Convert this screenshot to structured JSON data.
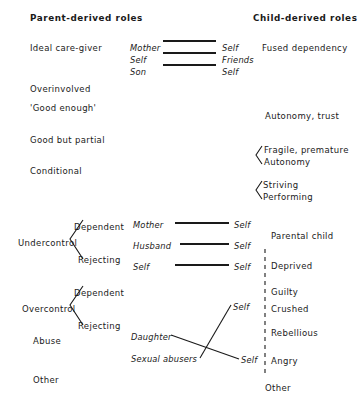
{
  "figure": {
    "headers": {
      "left": "Parent-derived roles",
      "right": "Child-derived roles"
    },
    "parent_roles": [
      {
        "label": "Ideal care-giver",
        "x": 30,
        "y": 44
      },
      {
        "label": "Overinvolved",
        "x": 30,
        "y": 85
      },
      {
        "label": "'Good enough'",
        "x": 30,
        "y": 104
      },
      {
        "label": "Good but partial",
        "x": 30,
        "y": 136
      },
      {
        "label": "Conditional",
        "x": 30,
        "y": 167
      },
      {
        "label": "Undercontrol",
        "x": 18,
        "y": 239
      },
      {
        "label": "Overcontrol",
        "x": 22,
        "y": 305
      },
      {
        "label": "Abuse",
        "x": 33,
        "y": 337
      },
      {
        "label": "Other",
        "x": 33,
        "y": 376
      }
    ],
    "branch_labels": [
      {
        "label": "Dependent",
        "x": 74,
        "y": 223
      },
      {
        "label": "Rejecting",
        "x": 78,
        "y": 256
      },
      {
        "label": "Dependent",
        "x": 74,
        "y": 289
      },
      {
        "label": "Rejecting",
        "x": 78,
        "y": 322
      }
    ],
    "child_roles": [
      {
        "label": "Fused dependency",
        "x": 262,
        "y": 46
      },
      {
        "label": "Autonomy, trust",
        "x": 265,
        "y": 114
      },
      {
        "label": "Fragile, premature",
        "x": 264,
        "y": 150
      },
      {
        "label": "Autonomy",
        "x": 264,
        "y": 161
      },
      {
        "label": "Striving",
        "x": 263,
        "y": 184
      },
      {
        "label": "Performing",
        "x": 263,
        "y": 195
      },
      {
        "label": "Parental child",
        "x": 271,
        "y": 234
      },
      {
        "label": "Deprived",
        "x": 271,
        "y": 263
      },
      {
        "label": "Guilty",
        "x": 271,
        "y": 290
      },
      {
        "label": "Crushed",
        "x": 271,
        "y": 308
      },
      {
        "label": "Rebellious",
        "x": 271,
        "y": 331
      },
      {
        "label": "Angry",
        "x": 271,
        "y": 360
      },
      {
        "label": "Other",
        "x": 265,
        "y": 386
      }
    ],
    "role_pairs": [
      {
        "left": "Mother",
        "left_x": 130,
        "right": "Self",
        "right_x": 222,
        "y": 44,
        "line": {
          "x1": 163,
          "x2": 216,
          "y": 41
        }
      },
      {
        "left": "Self",
        "left_x": 130,
        "right": "Friends",
        "right_x": 222,
        "y": 56,
        "line": {
          "x1": 163,
          "x2": 216,
          "y": 53
        }
      },
      {
        "left": "Son",
        "left_x": 130,
        "right": "Self",
        "right_x": 222,
        "y": 68,
        "line": {
          "x1": 163,
          "x2": 216,
          "y": 65
        }
      },
      {
        "left": "Mother",
        "left_x": 133,
        "right": "Self",
        "right_x": 234,
        "y": 226,
        "line": {
          "x1": 175,
          "x2": 229,
          "y": 223
        }
      },
      {
        "left": "Husband",
        "left_x": 133,
        "right": "Self",
        "right_x": 234,
        "y": 247,
        "line": {
          "x1": 180,
          "x2": 229,
          "y": 244
        }
      },
      {
        "left": "Self",
        "left_x": 133,
        "right": "Self",
        "right_x": 234,
        "y": 268,
        "line": {
          "x1": 175,
          "x2": 229,
          "y": 265
        }
      }
    ],
    "crossing": {
      "left_labels": [
        {
          "label": "Daughter",
          "x": 131,
          "y": 338
        },
        {
          "label": "Sexual abusers",
          "x": 131,
          "y": 360
        }
      ],
      "right_labels": [
        {
          "label": "Self",
          "x": 233,
          "y": 308
        },
        {
          "label": "Self",
          "x": 241,
          "y": 361
        }
      ],
      "lines": [
        {
          "x1": 171,
          "y1": 335,
          "x2": 239,
          "y2": 359
        },
        {
          "x1": 200,
          "y1": 358,
          "x2": 231,
          "y2": 305
        }
      ]
    },
    "brackets": [
      {
        "name": "undercontrol-bracket",
        "apex_x": 70,
        "apex_y": 239,
        "top_x": 83,
        "top_y": 220,
        "bottom_x": 83,
        "bottom_y": 259
      },
      {
        "name": "overcontrol-bracket",
        "apex_x": 70,
        "apex_y": 305,
        "top_x": 83,
        "top_y": 286,
        "bottom_x": 83,
        "bottom_y": 325
      }
    ],
    "chevrons": [
      {
        "name": "fragile-autonomy-chevron",
        "x1": 256,
        "y1": 155,
        "ax": 262,
        "ay": 146,
        "bx": 262,
        "by": 164
      },
      {
        "name": "striving-performing-chevron",
        "x1": 256,
        "y1": 190,
        "ax": 262,
        "ay": 181,
        "bx": 262,
        "by": 199
      }
    ],
    "divider": {
      "name": "dashed-divider",
      "x": 265,
      "y1": 249,
      "y2": 376
    },
    "colors": {
      "ink": "#1a1a1a",
      "background": "#ffffff"
    }
  }
}
